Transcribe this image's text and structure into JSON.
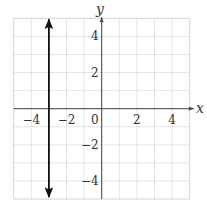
{
  "chart_data": {
    "type": "line",
    "title": "",
    "xlabel": "x",
    "ylabel": "y",
    "xlim": [
      -5,
      5
    ],
    "ylim": [
      -5,
      5
    ],
    "grid": true,
    "x_ticks": [
      -4,
      -2,
      0,
      2,
      4
    ],
    "y_ticks": [
      4,
      2,
      -2,
      -4
    ],
    "x_tick_labels": [
      "−4",
      "−2",
      "0",
      "2",
      "4"
    ],
    "y_tick_labels": [
      "4",
      "2",
      "−2",
      "−4"
    ],
    "series": [
      {
        "name": "x = -3",
        "kind": "vertical-line",
        "x": [
          -3,
          -3
        ],
        "y": [
          -5,
          5
        ],
        "arrows": "both",
        "color": "#111111"
      }
    ],
    "colors": {
      "grid": "#c8c8c8",
      "axis": "#444444",
      "line": "#111111"
    }
  }
}
